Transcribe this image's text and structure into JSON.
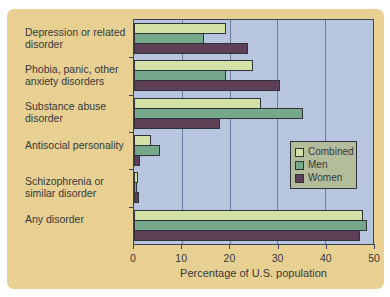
{
  "colors": {
    "panel_bg": "#e8d092",
    "plot_bg": "#b7c5de",
    "grid": "#6b7ca1",
    "frame": "#3c4357",
    "combined": "#d3e0a6",
    "men": "#76a98c",
    "women": "#5d4056",
    "legend_bg": "#b4bd9b",
    "bar_border": "#2d3338",
    "text": "#35383b"
  },
  "chart_data": {
    "type": "bar",
    "orientation": "horizontal",
    "title": "",
    "xlabel": "Percentage of U.S. population",
    "ylabel": "",
    "xlim": [
      0,
      50
    ],
    "xticks": [
      0,
      10,
      20,
      30,
      40,
      50
    ],
    "grid": true,
    "legend_position": "middle-right",
    "categories": [
      {
        "name": "Depression or related disorder",
        "lines": [
          "Depression or related",
          "disorder"
        ]
      },
      {
        "name": "Phobia, panic, other anxiety disorders",
        "lines": [
          "Phobia, panic, other",
          "anxiety disorders"
        ]
      },
      {
        "name": "Substance abuse disorder",
        "lines": [
          "Substance abuse",
          "disorder"
        ]
      },
      {
        "name": "Antisocial personality",
        "lines": [
          "Antisocial personality"
        ]
      },
      {
        "name": "Schizophrenia or similar disorder",
        "lines": [
          "Schizophrenia or",
          "similar disorder"
        ]
      },
      {
        "name": "Any disorder",
        "lines": [
          "Any disorder"
        ]
      }
    ],
    "series": [
      {
        "name": "Combined",
        "key": "combined",
        "values": [
          19.3,
          24.9,
          26.6,
          3.5,
          0.8,
          48.0
        ]
      },
      {
        "name": "Men",
        "key": "men",
        "values": [
          14.7,
          19.2,
          35.4,
          5.5,
          0.7,
          48.7
        ]
      },
      {
        "name": "Women",
        "key": "women",
        "values": [
          23.9,
          30.5,
          17.9,
          1.3,
          1.0,
          47.3
        ]
      }
    ]
  },
  "legend": {
    "items": [
      {
        "label": "Combined"
      },
      {
        "label": "Men"
      },
      {
        "label": "Women"
      }
    ]
  }
}
